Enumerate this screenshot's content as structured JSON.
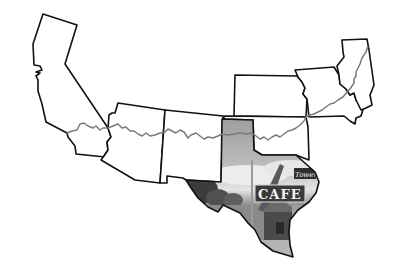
{
  "map": {
    "title": "",
    "description": "Outline map of US states along Route 66 with Texas filled by a photograph of a roadside cafe",
    "states": [
      {
        "name": "California"
      },
      {
        "name": "Arizona"
      },
      {
        "name": "New Mexico"
      },
      {
        "name": "Texas",
        "fill": "photo"
      },
      {
        "name": "Oklahoma"
      },
      {
        "name": "Kansas"
      },
      {
        "name": "Missouri"
      },
      {
        "name": "Illinois"
      }
    ],
    "route": {
      "name": "Route 66",
      "color": "#7a7a7a"
    },
    "photo": {
      "sign_main": "CAFE",
      "sign_small": "Tower"
    },
    "colors": {
      "outline": "#111111",
      "panhandle_fill": "#9a9a9a",
      "background": "#ffffff"
    }
  }
}
